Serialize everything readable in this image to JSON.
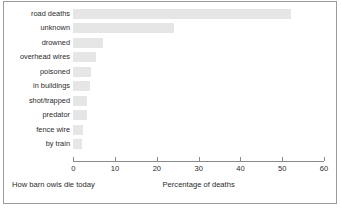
{
  "chart_data": {
    "type": "bar",
    "orientation": "horizontal",
    "title": "",
    "subtitle": "",
    "caption_left": "How barn owls die today",
    "xlabel": "Percentage of deaths",
    "ylabel": "",
    "categories": [
      "road deaths",
      "unknown",
      "drowned",
      "overhead wires",
      "poisoned",
      "in buildings",
      "shot/trapped",
      "predator",
      "fence wire",
      "by train"
    ],
    "values": [
      52,
      24,
      7,
      5.4,
      4.2,
      4,
      3.3,
      3.3,
      2.4,
      2.1
    ],
    "xticks": [
      0,
      10,
      20,
      30,
      40,
      50,
      60
    ],
    "xticklabels": [
      "0",
      "10",
      "20",
      "30",
      "40",
      "50",
      "60"
    ],
    "xlim": [
      0,
      60
    ],
    "grid": false,
    "legend": null,
    "bar_color": "#e6e6e6",
    "axis_color": "#8a8a8a",
    "text_color": "#2b2b2b",
    "frame_color": "#9b9b9b"
  }
}
